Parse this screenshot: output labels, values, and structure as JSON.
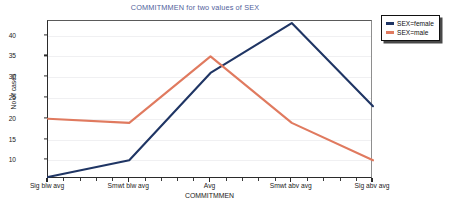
{
  "chart_data": {
    "type": "line",
    "title": "COMMITMMEN for two values of SEX",
    "xlabel": "COMMITMMEN",
    "ylabel": "No of cases",
    "categories": [
      "Sig blw avg",
      "Smwt blw avg",
      "Avg",
      "Smwt abv avg",
      "Sig abv avg"
    ],
    "yticks": [
      10,
      15,
      20,
      25,
      30,
      35,
      40
    ],
    "ylim": [
      5.5,
      43.5
    ],
    "grid": true,
    "legend_position": "top-right-outside",
    "series": [
      {
        "name": "SEX=female",
        "color": "#1f3564",
        "values": [
          6,
          10,
          31,
          43,
          23
        ]
      },
      {
        "name": "SEX=male",
        "color": "#e07a5f",
        "values": [
          20,
          19,
          35,
          19,
          10
        ]
      }
    ]
  },
  "legend": {
    "entries": [
      {
        "label": "SEX=female",
        "color": "#1f3564"
      },
      {
        "label": "SEX=male",
        "color": "#e07a5f"
      }
    ]
  },
  "colors": {
    "title": "#51619b",
    "female": "#1f3564",
    "male": "#e07a5f",
    "grid": "#f0f0f2",
    "axis": "#2b2b2b",
    "background": "#ffffff"
  }
}
